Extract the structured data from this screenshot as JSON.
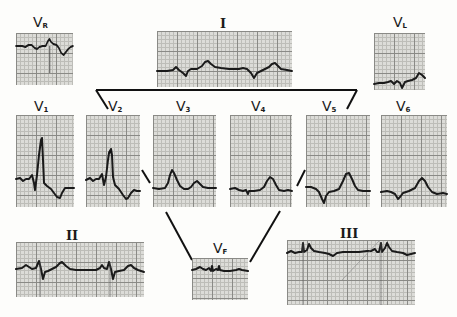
{
  "figure": {
    "leads": {
      "VR": {
        "letter": "V",
        "sub": "R"
      },
      "I": {
        "roman": "I"
      },
      "VL": {
        "letter": "V",
        "sub": "L"
      },
      "V1": {
        "letter": "V",
        "sub": "1"
      },
      "V2": {
        "letter": "V",
        "sub": "2"
      },
      "V3": {
        "letter": "V",
        "sub": "3"
      },
      "V4": {
        "letter": "V",
        "sub": "4"
      },
      "V5": {
        "letter": "V",
        "sub": "5"
      },
      "V6": {
        "letter": "V",
        "sub": "6"
      },
      "II": {
        "roman": "II"
      },
      "VF": {
        "letter": "V",
        "sub": "F"
      },
      "III": {
        "roman": "III"
      }
    },
    "colors": {
      "paper": "#dcdcd8",
      "grid_major": "#8a8a86",
      "grid_minor": "#bdbdb8",
      "trace": "#1a1a1a",
      "background": "#fdfdfb"
    }
  }
}
